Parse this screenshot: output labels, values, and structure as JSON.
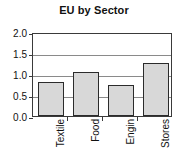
{
  "chart_data": {
    "type": "bar",
    "title": "EU by Sector",
    "xlabel": "",
    "ylabel": "",
    "categories": [
      "Textile",
      "Food",
      "Engin",
      "Stores"
    ],
    "values": [
      0.8,
      1.05,
      0.74,
      1.26
    ],
    "ylim": [
      0.0,
      2.0
    ],
    "yticks": [
      0.0,
      0.5,
      1.0,
      1.5,
      2.0
    ],
    "ytick_labels": [
      "0.0",
      "0.5",
      "1.0",
      "1.5",
      "2.0"
    ],
    "grid": true,
    "grid_axis": "y",
    "legend": false,
    "bar_fill_color": "#d8d8d8",
    "bar_edge_color": "#2b2b2b",
    "grid_color": "#8a8a8a",
    "axis_color": "#3a3a3a",
    "background_color": "#ffffff",
    "text_color": "#111111"
  }
}
